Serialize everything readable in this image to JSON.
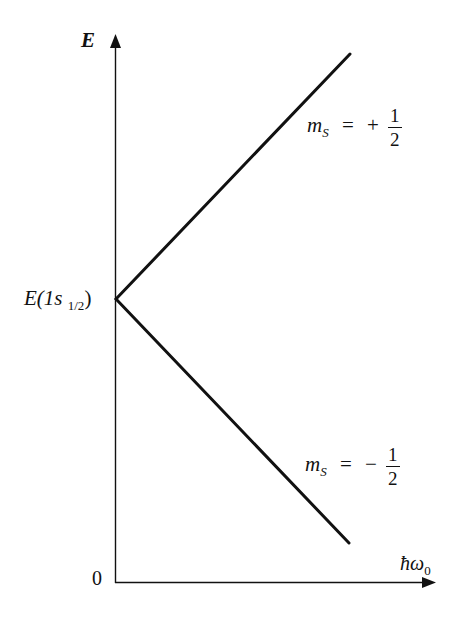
{
  "diagram": {
    "type": "energy-level splitting diagram",
    "y_axis": {
      "label": "E",
      "origin_label": "0"
    },
    "x_axis": {
      "label": "ħω",
      "label_subscript": "0"
    },
    "level": {
      "label_main": "E(1s",
      "label_subscript": "1/2",
      "label_close": ")"
    },
    "lines": [
      {
        "name": "upper",
        "label_var": "m",
        "label_sub": "S",
        "label_eq": "=",
        "sign": "+",
        "numerator": "1",
        "denominator": "2"
      },
      {
        "name": "lower",
        "label_var": "m",
        "label_sub": "S",
        "label_eq": "=",
        "sign": "−",
        "numerator": "1",
        "denominator": "2"
      }
    ],
    "colors": {
      "ink": "#111111",
      "background": "#ffffff"
    }
  }
}
